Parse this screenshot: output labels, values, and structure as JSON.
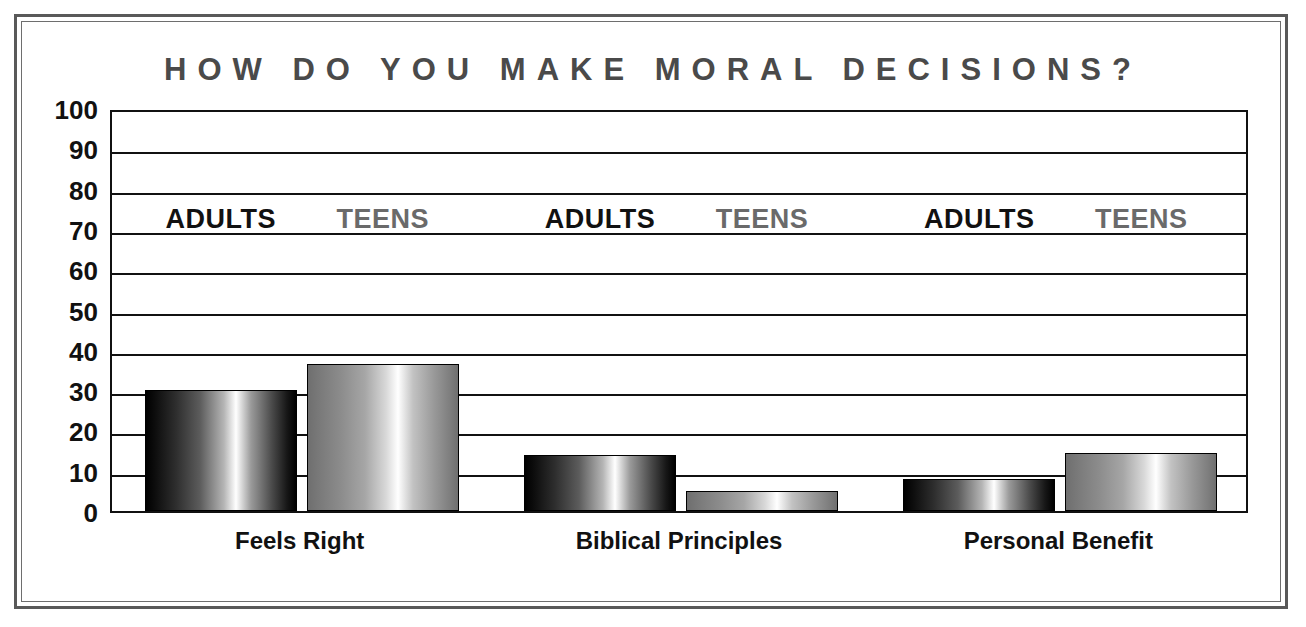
{
  "chart_data": {
    "type": "bar",
    "title": "HOW DO YOU MAKE MORAL DECISIONS?",
    "xlabel": "",
    "ylabel": "",
    "ylim": [
      0,
      100
    ],
    "ytick_step": 10,
    "yticks": [
      100,
      90,
      80,
      70,
      60,
      50,
      40,
      30,
      20,
      10,
      0
    ],
    "grid": true,
    "legend_position": "in-plot",
    "categories": [
      "Feels Right",
      "Biblical Principles",
      "Personal Benefit"
    ],
    "series": [
      {
        "name": "ADULTS",
        "color": "#1a1a1a",
        "values": [
          30,
          14,
          8
        ]
      },
      {
        "name": "TEENS",
        "color": "#8c8c8c",
        "values": [
          36.5,
          5,
          14.5
        ]
      }
    ],
    "inplot_labels": [
      {
        "series": "ADULTS",
        "category": "Feels Right"
      },
      {
        "series": "TEENS",
        "category": "Feels Right"
      },
      {
        "series": "ADULTS",
        "category": "Biblical Principles"
      },
      {
        "series": "TEENS",
        "category": "Biblical Principles"
      },
      {
        "series": "ADULTS",
        "category": "Personal Benefit"
      },
      {
        "series": "TEENS",
        "category": "Personal Benefit"
      }
    ]
  },
  "frame": {
    "border_color": "#595959",
    "background": "#ffffff"
  }
}
